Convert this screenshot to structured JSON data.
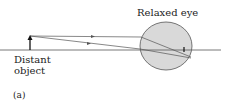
{
  "diagram": {
    "eye_label": "Relaxed eye",
    "object_label_line1": "Distant",
    "object_label_line2": "object",
    "panel_label": "(a)",
    "colors": {
      "eye_fill": "#d9d9d9",
      "stroke": "#555555",
      "text": "#222222"
    }
  }
}
